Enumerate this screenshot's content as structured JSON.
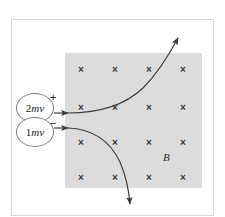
{
  "figure": {
    "field_label": "B",
    "field_direction": "into-page",
    "colors": {
      "field_fill": "#dcdcdc",
      "frame_border": "#d8d8d8",
      "curve": "#3d3d3d",
      "cross": "#3a3a3a",
      "circle_border": "#7a7a7a"
    }
  },
  "particles": [
    {
      "id": "positive",
      "magnitude": "2",
      "symbol": "mv",
      "charge_sign": "+",
      "label": "2mv",
      "deflection": "upward"
    },
    {
      "id": "negative",
      "magnitude": "1",
      "symbol": "mv",
      "charge_sign": "−",
      "label": "1mv",
      "deflection": "downward"
    }
  ],
  "field_grid": {
    "symbol": "×",
    "rows": 4,
    "columns": 4,
    "x_positions": [
      81,
      115,
      149,
      183
    ],
    "y_positions": [
      70,
      108,
      143,
      178
    ]
  }
}
